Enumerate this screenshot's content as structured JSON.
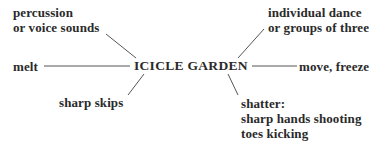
{
  "diagram": {
    "center": "ICICLE GARDEN",
    "nodes": [
      {
        "id": "percussion",
        "lines": [
          "percussion",
          "or voice sounds"
        ]
      },
      {
        "id": "individual",
        "lines": [
          "individual dance",
          "or groups of three"
        ]
      },
      {
        "id": "melt",
        "lines": [
          "melt"
        ]
      },
      {
        "id": "move",
        "lines": [
          "move, freeze"
        ]
      },
      {
        "id": "skips",
        "lines": [
          "sharp skips"
        ]
      },
      {
        "id": "shatter",
        "lines": [
          "shatter:",
          "sharp hands shooting",
          "toes kicking"
        ]
      }
    ]
  }
}
